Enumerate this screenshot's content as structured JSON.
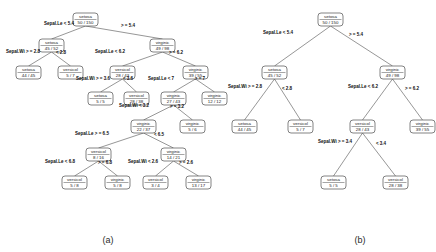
{
  "figure": {
    "width": 436,
    "height": 252,
    "background": "#ffffff",
    "node_stroke": "#4d4d4d",
    "edge_stroke": "#6a6a6a",
    "text_color": "#1a1a1a"
  },
  "panels": [
    {
      "id": "panel-a",
      "caption": "(a)",
      "caption_x": 108,
      "caption_y": 243,
      "description": "full unpruned classification tree",
      "nodes": [
        {
          "id": "a-n1",
          "label": "setosa",
          "counts": "50 / 150",
          "x": 73,
          "y": 13
        },
        {
          "id": "a-n2",
          "label": "setosa",
          "counts": "45 / 52",
          "x": 39,
          "y": 39
        },
        {
          "id": "a-n3",
          "label": "virginic",
          "counts": "49 / 98",
          "x": 150,
          "y": 39
        },
        {
          "id": "a-n4",
          "label": "setosa",
          "counts": "44 / 45",
          "x": 16,
          "y": 66
        },
        {
          "id": "a-n5",
          "label": "versicol",
          "counts": "5 / 7",
          "x": 58,
          "y": 66
        },
        {
          "id": "a-n6",
          "label": "versicol",
          "counts": "28 / 43",
          "x": 110,
          "y": 66
        },
        {
          "id": "a-n7",
          "label": "virginic",
          "counts": "39 / 55",
          "x": 183,
          "y": 66
        },
        {
          "id": "a-n8",
          "label": "setosa",
          "counts": "5 / 5",
          "x": 88,
          "y": 92
        },
        {
          "id": "a-n9",
          "label": "versicol",
          "counts": "28 / 38",
          "x": 124,
          "y": 92
        },
        {
          "id": "a-n10",
          "label": "virginic",
          "counts": "27 / 43",
          "x": 161,
          "y": 92
        },
        {
          "id": "a-n11",
          "label": "virginic",
          "counts": "12 / 12",
          "x": 202,
          "y": 92
        },
        {
          "id": "a-n12",
          "label": "virginic",
          "counts": "22 / 37",
          "x": 131,
          "y": 120
        },
        {
          "id": "a-n13",
          "label": "virginic",
          "counts": "5 / 6",
          "x": 180,
          "y": 120
        },
        {
          "id": "a-n14",
          "label": "versicol",
          "counts": "8 / 16",
          "x": 86,
          "y": 148
        },
        {
          "id": "a-n15",
          "label": "virginic",
          "counts": "14 / 21",
          "x": 161,
          "y": 148
        },
        {
          "id": "a-n16",
          "label": "versicol",
          "counts": "5 / 8",
          "x": 62,
          "y": 176
        },
        {
          "id": "a-n17",
          "label": "virginic",
          "counts": "5 / 8",
          "x": 105,
          "y": 176
        },
        {
          "id": "a-n18",
          "label": "versicol",
          "counts": "3 / 4",
          "x": 143,
          "y": 176
        },
        {
          "id": "a-n19",
          "label": "virginic",
          "counts": "13 / 17",
          "x": 186,
          "y": 176
        }
      ],
      "edges": [
        {
          "from": "a-n1",
          "to": "a-n2",
          "label": "Sepal.Le < 5.4",
          "bold": true,
          "lx": 59,
          "ly": 25
        },
        {
          "from": "a-n1",
          "to": "a-n3",
          "label": "> = 5.4",
          "bold": true,
          "lx": 128,
          "ly": 27
        },
        {
          "from": "a-n2",
          "to": "a-n4",
          "label": "Sepal.Wi > = 2.8",
          "bold": true,
          "lx": 23,
          "ly": 53
        },
        {
          "from": "a-n2",
          "to": "a-n5",
          "label": "< 2.8",
          "bold": true,
          "lx": 61,
          "ly": 54
        },
        {
          "from": "a-n3",
          "to": "a-n6",
          "label": "Sepal.Le < 6.2",
          "bold": true,
          "lx": 110,
          "ly": 53
        },
        {
          "from": "a-n3",
          "to": "a-n7",
          "label": "> = 6.2",
          "bold": true,
          "lx": 176,
          "ly": 54
        },
        {
          "from": "a-n6",
          "to": "a-n8",
          "label": "Sepal.Wi > = 3.6",
          "bold": true,
          "lx": 93,
          "ly": 80
        },
        {
          "from": "a-n6",
          "to": "a-n9",
          "label": "< 3.6",
          "bold": true,
          "lx": 128,
          "ly": 80
        },
        {
          "from": "a-n7",
          "to": "a-n10",
          "label": "Sepal.Le < 7",
          "bold": true,
          "lx": 161,
          "ly": 80
        },
        {
          "from": "a-n7",
          "to": "a-n11",
          "label": "> = 7",
          "bold": true,
          "lx": 200,
          "ly": 80
        },
        {
          "from": "a-n10",
          "to": "a-n12",
          "label": "Sepal.Wi < 3.2",
          "bold": true,
          "lx": 134,
          "ly": 107
        },
        {
          "from": "a-n10",
          "to": "a-n13",
          "label": "> = 3.2",
          "bold": true,
          "lx": 177,
          "ly": 108
        },
        {
          "from": "a-n12",
          "to": "a-n14",
          "label": "Sepal.Le > = 6.5",
          "bold": true,
          "lx": 92,
          "ly": 135
        },
        {
          "from": "a-n12",
          "to": "a-n15",
          "label": "< 6.5",
          "bold": true,
          "lx": 159,
          "ly": 136
        },
        {
          "from": "a-n14",
          "to": "a-n16",
          "label": "Sepal.Le < 6.8",
          "bold": true,
          "lx": 60,
          "ly": 163
        },
        {
          "from": "a-n14",
          "to": "a-n17",
          "label": "> = 6.8",
          "bold": true,
          "lx": 105,
          "ly": 164
        },
        {
          "from": "a-n15",
          "to": "a-n18",
          "label": "Sepal.Wi < 2.6",
          "bold": true,
          "lx": 143,
          "ly": 163
        },
        {
          "from": "a-n15",
          "to": "a-n19",
          "label": "> = 2.6",
          "bold": true,
          "lx": 186,
          "ly": 164
        }
      ]
    },
    {
      "id": "panel-b",
      "caption": "(b)",
      "caption_x": 360,
      "caption_y": 243,
      "description": "pruned classification tree",
      "nodes": [
        {
          "id": "b-n1",
          "label": "setosa",
          "counts": "50 / 150",
          "x": 318,
          "y": 13
        },
        {
          "id": "b-n2",
          "label": "setosa",
          "counts": "45 / 52",
          "x": 262,
          "y": 66
        },
        {
          "id": "b-n3",
          "label": "virginic",
          "counts": "49 / 98",
          "x": 380,
          "y": 66
        },
        {
          "id": "b-n4",
          "label": "setosa",
          "counts": "44 / 45",
          "x": 232,
          "y": 120
        },
        {
          "id": "b-n5",
          "label": "versicol",
          "counts": "5 / 7",
          "x": 288,
          "y": 120
        },
        {
          "id": "b-n6",
          "label": "versicol",
          "counts": "28 / 43",
          "x": 350,
          "y": 120
        },
        {
          "id": "b-n7",
          "label": "virginic",
          "counts": "39 / 55",
          "x": 410,
          "y": 120
        },
        {
          "id": "b-n8",
          "label": "setosa",
          "counts": "5 / 5",
          "x": 321,
          "y": 176
        },
        {
          "id": "b-n9",
          "label": "versicol",
          "counts": "28 / 38",
          "x": 383,
          "y": 176
        }
      ],
      "edges": [
        {
          "from": "b-n1",
          "to": "b-n2",
          "label": "Sepal.Le < 5.4",
          "bold": true,
          "lx": 278,
          "ly": 34
        },
        {
          "from": "b-n1",
          "to": "b-n3",
          "label": "> = 5.4",
          "bold": true,
          "lx": 356,
          "ly": 36
        },
        {
          "from": "b-n2",
          "to": "b-n4",
          "label": "Sepal.Wi > = 2.8",
          "bold": true,
          "lx": 245,
          "ly": 88
        },
        {
          "from": "b-n2",
          "to": "b-n5",
          "label": "< 2.8",
          "bold": true,
          "lx": 287,
          "ly": 90
        },
        {
          "from": "b-n3",
          "to": "b-n6",
          "label": "Sepal.Le < 6.2",
          "bold": true,
          "lx": 363,
          "ly": 88
        },
        {
          "from": "b-n3",
          "to": "b-n7",
          "label": "> = 6.2",
          "bold": true,
          "lx": 412,
          "ly": 90
        },
        {
          "from": "b-n6",
          "to": "b-n8",
          "label": "Sepal.Wi > = 3.4",
          "bold": true,
          "lx": 335,
          "ly": 143
        },
        {
          "from": "b-n6",
          "to": "b-n9",
          "label": "< 3.4",
          "bold": true,
          "lx": 381,
          "ly": 145
        }
      ]
    }
  ]
}
